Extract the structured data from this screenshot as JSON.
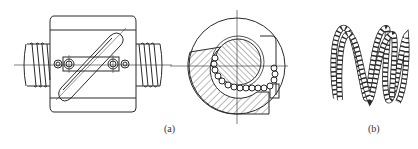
{
  "figure": {
    "panels": [
      {
        "id": "a",
        "label": "(a)",
        "description": "Ball screw nut with external return tube: front view and cross-section"
      },
      {
        "id": "b",
        "label": "(b)",
        "description": "Recirculating ball chain path"
      }
    ]
  },
  "colors": {
    "stroke": "#2a2a2a",
    "background": "#ffffff"
  }
}
